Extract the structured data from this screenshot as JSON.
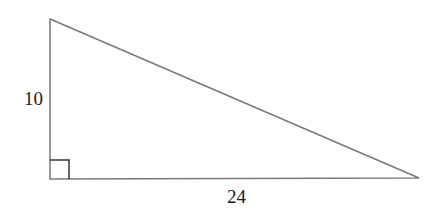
{
  "diagram": {
    "type": "right-triangle",
    "vertices": {
      "top": [
        50,
        19
      ],
      "right_angle": [
        50,
        179
      ],
      "right": [
        419,
        178
      ]
    },
    "sides": {
      "vertical_leg": {
        "label": "10"
      },
      "horizontal_leg": {
        "label": "24"
      }
    },
    "right_angle_marker": {
      "size": 19
    },
    "colors": {
      "stroke": "#7a7a7a",
      "marker": "#333333",
      "text": "#1a1a1a",
      "background": "#ffffff"
    }
  }
}
